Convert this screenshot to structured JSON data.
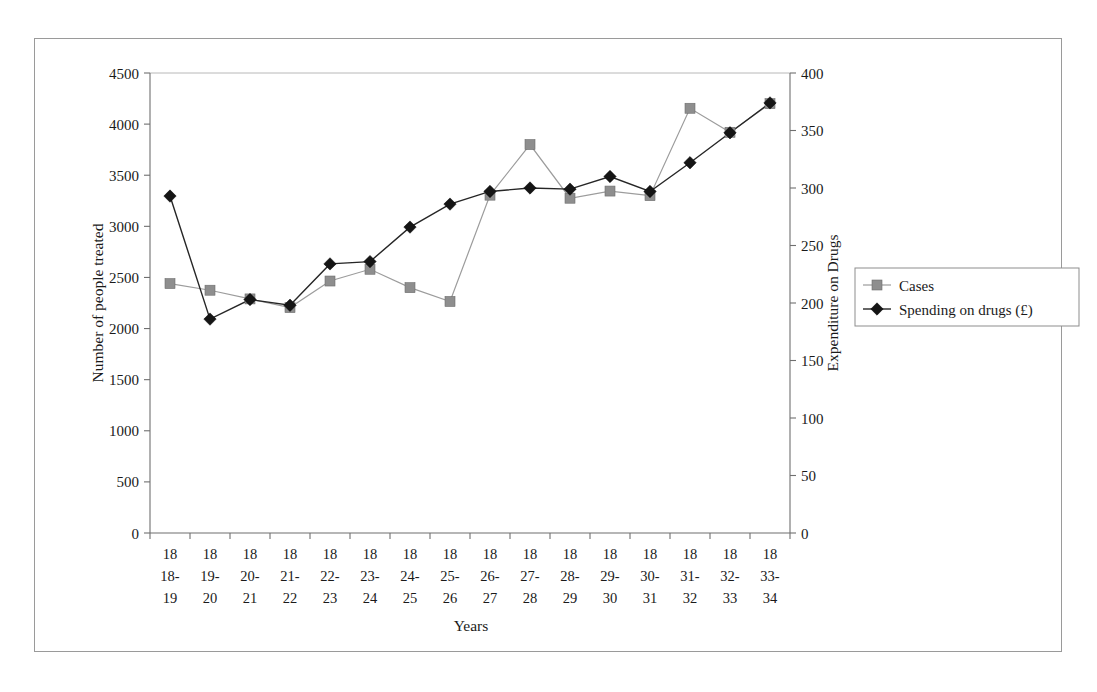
{
  "chart_data": {
    "type": "line",
    "title": "",
    "xlabel": "Years",
    "ylabel": "Number of people treated",
    "y2label": "Expenditure on Drugs",
    "ylim": [
      0,
      4500
    ],
    "y2lim": [
      0,
      400
    ],
    "ytick_step": 500,
    "y2tick_step": 50,
    "grid": false,
    "legend_position": "right",
    "categories": [
      "1818-19",
      "1819-20",
      "1820-21",
      "1821-22",
      "1822-23",
      "1823-24",
      "1824-25",
      "1825-26",
      "1826-27",
      "1827-28",
      "1828-29",
      "1829-30",
      "1830-31",
      "1831-32",
      "1832-33",
      "1833-34"
    ],
    "category_lines": [
      [
        "18",
        "18-",
        "19"
      ],
      [
        "18",
        "19-",
        "20"
      ],
      [
        "18",
        "20-",
        "21"
      ],
      [
        "18",
        "21-",
        "22"
      ],
      [
        "18",
        "22-",
        "23"
      ],
      [
        "18",
        "23-",
        "24"
      ],
      [
        "18",
        "24-",
        "25"
      ],
      [
        "18",
        "25-",
        "26"
      ],
      [
        "18",
        "26-",
        "27"
      ],
      [
        "18",
        "27-",
        "28"
      ],
      [
        "18",
        "28-",
        "29"
      ],
      [
        "18",
        "29-",
        "30"
      ],
      [
        "18",
        "30-",
        "31"
      ],
      [
        "18",
        "31-",
        "32"
      ],
      [
        "18",
        "32-",
        "33"
      ],
      [
        "18",
        "33-",
        "34"
      ]
    ],
    "yticks": [
      0,
      500,
      1000,
      1500,
      2000,
      2500,
      3000,
      3500,
      4000,
      4500
    ],
    "y2ticks": [
      0,
      50,
      100,
      150,
      200,
      250,
      300,
      350,
      400
    ],
    "series": [
      {
        "name": "Cases",
        "axis": "left",
        "marker": "square",
        "color": "#8e8e8e",
        "line_color": "#9c9c9c",
        "values": [
          2440,
          2375,
          2290,
          2205,
          2465,
          2580,
          2400,
          2265,
          3305,
          3800,
          3275,
          3345,
          3300,
          4155,
          3920,
          4200
        ]
      },
      {
        "name": "Spending on drugs (£)",
        "axis": "right",
        "marker": "diamond",
        "color": "#151515",
        "line_color": "#262626",
        "values": [
          293,
          186,
          203,
          198,
          234,
          236,
          266,
          286,
          297,
          300,
          299,
          310,
          297,
          322,
          348,
          374
        ]
      }
    ]
  },
  "legend": {
    "items": [
      {
        "label": "Cases",
        "marker": "square"
      },
      {
        "label": "Spending on drugs (£)",
        "marker": "diamond"
      }
    ]
  },
  "colors": {
    "cases": "#8e8e8e",
    "spending": "#151515",
    "axis": "#6f6f6f",
    "frame": "#9a9a9a",
    "background": "#ffffff"
  }
}
